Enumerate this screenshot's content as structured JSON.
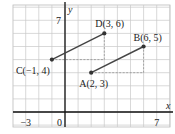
{
  "chart_data": {
    "type": "scatter",
    "title": "",
    "xlabel": "x",
    "ylabel": "y",
    "xlim": [
      -4,
      8
    ],
    "ylim": [
      -1,
      8
    ],
    "grid": true,
    "tick_labels": {
      "x": [
        "-3",
        "0",
        "7"
      ],
      "y": [
        "7"
      ]
    },
    "points": [
      {
        "name": "A",
        "x": 2,
        "y": 3,
        "label": "A(2, 3)"
      },
      {
        "name": "B",
        "x": 6,
        "y": 5,
        "label": "B(6, 5)"
      },
      {
        "name": "C",
        "x": -1,
        "y": 4,
        "label": "C(−1, 4)"
      },
      {
        "name": "D",
        "x": 3,
        "y": 6,
        "label": "D(3, 6)"
      }
    ],
    "segments": [
      [
        "A",
        "B"
      ],
      [
        "C",
        "D"
      ]
    ],
    "dashed_guides": [
      {
        "from": [
          2,
          3
        ],
        "to": [
          6,
          3
        ]
      },
      {
        "from": [
          6,
          3
        ],
        "to": [
          6,
          5
        ]
      },
      {
        "from": [
          -1,
          4
        ],
        "to": [
          3,
          4
        ]
      },
      {
        "from": [
          3,
          4
        ],
        "to": [
          3,
          6
        ]
      }
    ]
  },
  "labels": {
    "x_axis": "x",
    "y_axis": "y",
    "tick_neg3": "−3",
    "tick_0": "0",
    "tick_x7": "7",
    "tick_y7": "7",
    "A": "A(2, 3)",
    "B": "B(6, 5)",
    "C": "C(−1, 4)",
    "D": "D(3, 6)"
  }
}
